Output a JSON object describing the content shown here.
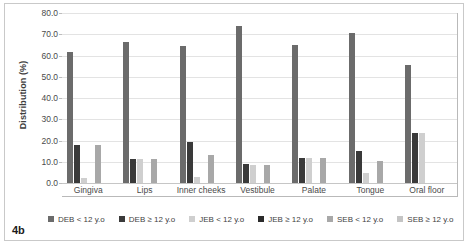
{
  "figure": {
    "label": "4b"
  },
  "chart_data": {
    "type": "bar",
    "title": "",
    "xlabel": "",
    "ylabel": "Distribution (%)",
    "ylim": [
      0,
      80
    ],
    "ytick_step": 10,
    "ytick_labels": [
      "0.0",
      "10.0",
      "20.0",
      "30.0",
      "40.0",
      "50.0",
      "60.0",
      "70.0",
      "80.0"
    ],
    "grid": true,
    "legend_position": "bottom",
    "categories": [
      "Gingiva",
      "Lips",
      "Inner cheeks",
      "Vestibule",
      "Palate",
      "Tongue",
      "Oral floor"
    ],
    "series": [
      {
        "name": "DEB < 12 y.o",
        "color": "#6b6b6b",
        "values": [
          61.5,
          66.5,
          64.5,
          74.0,
          65.0,
          70.5,
          55.5
        ]
      },
      {
        "name": "DEB ≥ 12 y.o",
        "color": "#3a3a3a",
        "values": [
          17.8,
          11.3,
          19.5,
          9.0,
          12.0,
          15.0,
          23.5
        ]
      },
      {
        "name": "JEB < 12 y.o",
        "color": "#cfcfcf",
        "values": [
          2.5,
          11.3,
          3.0,
          8.5,
          12.0,
          4.5,
          23.5
        ]
      },
      {
        "name": "JEB ≥ 12 y.o",
        "color": "#2b2b2b",
        "values": [
          0,
          0,
          0,
          0,
          0,
          0,
          0
        ]
      },
      {
        "name": "SEB < 12 y.o",
        "color": "#a8a8a8",
        "values": [
          17.8,
          11.3,
          13.0,
          8.5,
          12.0,
          10.5,
          0
        ]
      },
      {
        "name": "SEB ≥ 12 y.o",
        "color": "#c4c4c4",
        "values": [
          0,
          0,
          0,
          0,
          0,
          0,
          0
        ]
      }
    ]
  },
  "legend": {
    "items": [
      {
        "label": "DEB < 12 y.o",
        "color": "#6b6b6b"
      },
      {
        "label": "DEB ≥ 12 y.o",
        "color": "#3a3a3a"
      },
      {
        "label": "JEB < 12 y.o",
        "color": "#cfcfcf"
      },
      {
        "label": "JEB ≥ 12 y.o",
        "color": "#2b2b2b"
      },
      {
        "label": "SEB < 12 y.o",
        "color": "#a8a8a8"
      },
      {
        "label": "SEB ≥ 12 y.o",
        "color": "#c4c4c4"
      }
    ]
  }
}
